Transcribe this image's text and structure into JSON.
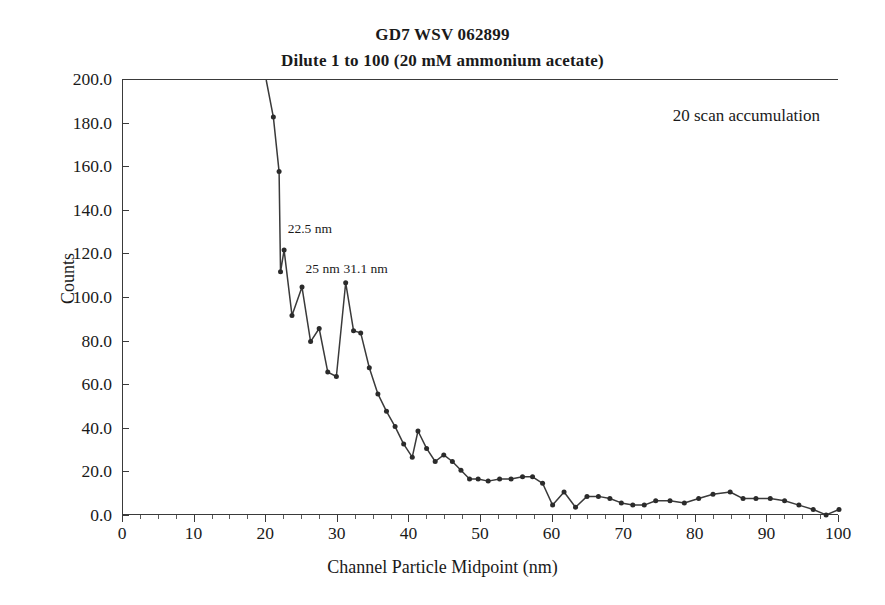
{
  "figure": {
    "title": "GD7 WSV 062899",
    "subtitle": "Dilute 1 to 100 (20 mM ammonium acetate)",
    "note": "20 scan accumulation",
    "line_color": "#3a3a3a",
    "marker_color": "#2b2b2b",
    "axis_color": "#3a3a3a"
  },
  "chart_data": {
    "type": "line",
    "title": "GD7 WSV 062899",
    "subtitle": "Dilute 1 to 100 (20 mM ammonium acetate)",
    "xlabel": "Channel Particle Midpoint (nm)",
    "ylabel": "Counts",
    "xlim": [
      0,
      100
    ],
    "ylim": [
      0,
      200
    ],
    "xticks": [
      0,
      10,
      20,
      30,
      40,
      50,
      60,
      70,
      80,
      90,
      100
    ],
    "xticklabels": [
      "0",
      "10",
      "20",
      "30",
      "40",
      "50",
      "60",
      "70",
      "80",
      "90",
      "100"
    ],
    "yticks": [
      0,
      20,
      40,
      60,
      80,
      100,
      120,
      140,
      160,
      180,
      200
    ],
    "yticklabels": [
      "0.0",
      "20.0",
      "40.0",
      "60.0",
      "80.0",
      "100.0",
      "120.0",
      "140.0",
      "160.0",
      "180.0",
      "200.0"
    ],
    "grid": false,
    "legend": false,
    "markers": "filled-diamond",
    "annotations": [
      {
        "text": "20 scan accumulation",
        "x": 72.0,
        "y": 183.0
      },
      {
        "text": "22.5 nm",
        "x": 23.0,
        "y": 131.0
      },
      {
        "text": "25 nm",
        "x": 25.5,
        "y": 113.0
      },
      {
        "text": "31.1 nm",
        "x": 30.8,
        "y": 113.0
      }
    ],
    "x": [
      20.0,
      21.0,
      21.8,
      22.0,
      22.5,
      23.6,
      25.0,
      26.2,
      27.4,
      28.6,
      29.8,
      31.1,
      32.2,
      33.2,
      34.4,
      35.6,
      36.8,
      38.0,
      39.2,
      40.4,
      41.2,
      42.4,
      43.6,
      44.8,
      46.0,
      47.2,
      48.4,
      49.6,
      51.0,
      52.6,
      54.2,
      55.8,
      57.2,
      58.6,
      60.0,
      61.6,
      63.2,
      64.8,
      66.4,
      68.0,
      69.6,
      71.2,
      72.8,
      74.4,
      76.4,
      78.4,
      80.4,
      82.4,
      84.8,
      86.6,
      88.4,
      90.4,
      92.4,
      94.4,
      96.4,
      98.2,
      100.0
    ],
    "y": [
      200.0,
      183.0,
      158.0,
      112.0,
      122.0,
      92.0,
      105.0,
      80.0,
      86.0,
      66.0,
      64.0,
      107.0,
      85.0,
      84.0,
      68.0,
      56.0,
      48.0,
      41.0,
      33.0,
      27.0,
      39.0,
      31.0,
      25.0,
      28.0,
      25.0,
      21.0,
      17.0,
      17.0,
      16.0,
      17.0,
      17.0,
      18.0,
      18.0,
      15.0,
      5.0,
      11.0,
      4.0,
      9.0,
      9.0,
      8.0,
      6.0,
      5.0,
      5.0,
      7.0,
      7.0,
      6.0,
      8.0,
      10.0,
      11.0,
      8.0,
      8.0,
      8.0,
      7.0,
      5.0,
      3.0,
      0.5,
      3.0
    ]
  }
}
